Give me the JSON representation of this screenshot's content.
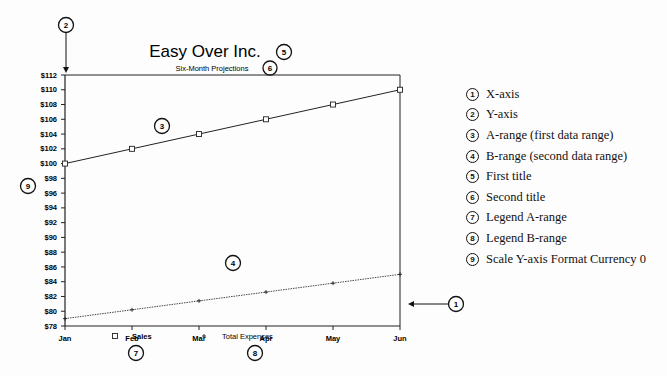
{
  "chart_data": {
    "type": "line",
    "title": "Easy Over Inc.",
    "subtitle": "Six-Month Projections",
    "xlabel": "",
    "ylabel": "",
    "categories": [
      "Jan",
      "Feb",
      "Mar",
      "Apr",
      "May",
      "Jun"
    ],
    "series": [
      {
        "name": "Sales",
        "marker": "square",
        "line": "solid",
        "values": [
          100,
          102,
          104,
          106,
          108,
          110
        ]
      },
      {
        "name": "Total Expenses",
        "marker": "plus",
        "line": "dotted",
        "values": [
          79,
          80.2,
          81.4,
          82.6,
          83.8,
          85
        ]
      }
    ],
    "ylim": [
      78,
      112
    ],
    "yticks": [
      "$78",
      "$80",
      "$82",
      "$84",
      "$86",
      "$88",
      "$90",
      "$92",
      "$94",
      "$96",
      "$98",
      "$100",
      "$102",
      "$104",
      "$106",
      "$108",
      "$110",
      "$112"
    ],
    "grid": false,
    "legend_position": "bottom"
  },
  "callouts": {
    "c1": "1",
    "c2": "2",
    "c3": "3",
    "c4": "4",
    "c5": "5",
    "c6": "6",
    "c7": "7",
    "c8": "8",
    "c9": "9"
  },
  "key": [
    {
      "num": "1",
      "label": "X-axis"
    },
    {
      "num": "2",
      "label": "Y-axis"
    },
    {
      "num": "3",
      "label": "A-range (first data range)"
    },
    {
      "num": "4",
      "label": "B-range (second data range)"
    },
    {
      "num": "5",
      "label": "First title"
    },
    {
      "num": "6",
      "label": "Second title"
    },
    {
      "num": "7",
      "label": "Legend A-range"
    },
    {
      "num": "8",
      "label": "Legend B-range"
    },
    {
      "num": "9",
      "label": "Scale Y-axis Format Currency 0"
    }
  ]
}
